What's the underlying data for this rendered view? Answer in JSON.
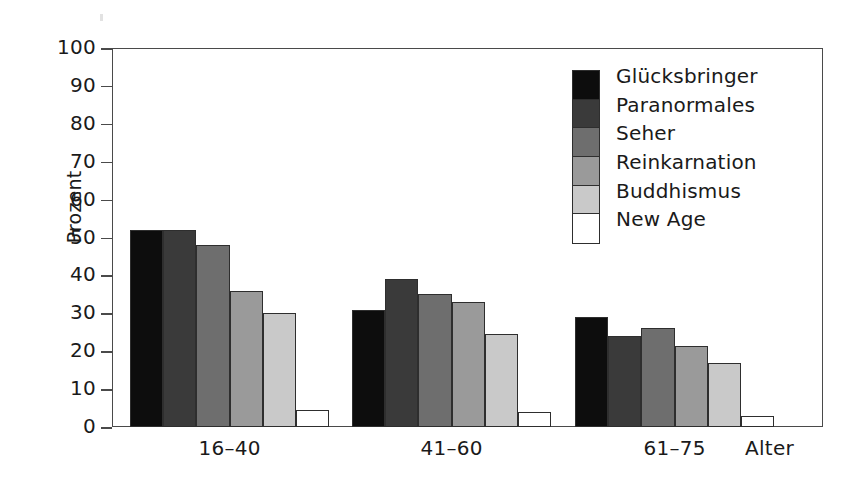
{
  "chart_data": {
    "type": "bar",
    "title": "",
    "xlabel": "Alter",
    "ylabel": "Prozent",
    "categories": [
      "16–40",
      "41–60",
      "61–75"
    ],
    "series": [
      {
        "name": "Glücksbringer",
        "color": "#0d0d0d",
        "values": [
          52,
          31,
          29
        ]
      },
      {
        "name": "Paranormales",
        "color": "#3a3a3a",
        "values": [
          52,
          39,
          24
        ]
      },
      {
        "name": "Seher",
        "color": "#6e6e6e",
        "values": [
          48,
          35,
          26
        ]
      },
      {
        "name": "Reinkarnation",
        "color": "#9a9a9a",
        "values": [
          36,
          33,
          21.5
        ]
      },
      {
        "name": "Buddhismus",
        "color": "#c9c9c9",
        "values": [
          30,
          24.5,
          17
        ]
      },
      {
        "name": "New Age",
        "color": "#ffffff",
        "values": [
          4.5,
          4,
          2.8
        ]
      }
    ],
    "ylim": [
      0,
      100
    ],
    "yticks": [
      0,
      10,
      20,
      30,
      40,
      50,
      60,
      70,
      80,
      90,
      100
    ],
    "ytick_labels": [
      "0",
      "10",
      "20",
      "30",
      "40",
      "50",
      "60",
      "70",
      "80",
      "90",
      "100"
    ],
    "grid": false,
    "legend_position": "top-right",
    "legend_entries": [
      "Glücksbringer",
      "Paranormales",
      "Seher",
      "Reinkarnation",
      "Buddhismus",
      "New Age"
    ],
    "axis_color": "#4a4a4a",
    "bar_edge_color": "#2e2e2e"
  }
}
